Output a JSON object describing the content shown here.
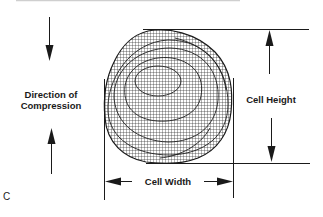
{
  "figure": {
    "panel_label": "C",
    "labels": {
      "compression_line1": "Direction of",
      "compression_line2": "Compression",
      "cell_height": "Cell Height",
      "cell_width": "Cell Width"
    },
    "colors": {
      "ink": "#1a1a1a",
      "mesh": "#2a2a2a",
      "background": "#ffffff",
      "top_rule": "#bdbdbd"
    }
  }
}
